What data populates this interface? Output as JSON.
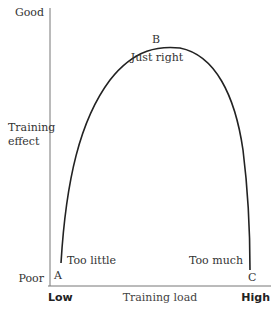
{
  "diagram": {
    "title": "",
    "y_axis": {
      "label_lines": [
        "Training",
        "effect"
      ],
      "top_label": "Good",
      "bottom_label": "Poor"
    },
    "x_axis": {
      "label": "Training load",
      "left_label": "Low",
      "right_label": "High"
    },
    "points": [
      {
        "id": "A",
        "label": "A",
        "caption": "Too little"
      },
      {
        "id": "B",
        "label": "B",
        "caption": "Just right"
      },
      {
        "id": "C",
        "label": "C",
        "caption": "Too much"
      }
    ],
    "curve": {
      "shape": "inverted-U",
      "description": "Training effect rises from poor at low load to good at optimal load, then falls to poor at high load",
      "color": "#222222"
    }
  }
}
